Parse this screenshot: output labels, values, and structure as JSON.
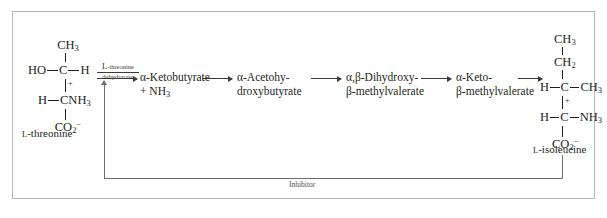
{
  "diagram": {
    "border_color": "#b9b9b9",
    "background": "#ffffff",
    "text_color": "#231f20"
  },
  "substrate": {
    "name": "L-threonine",
    "name_prefix": "L",
    "name_rest": "-threonine",
    "atoms": {
      "top": "CH",
      "top_sub": "3",
      "left": "HO",
      "center": "C",
      "right": "H",
      "lower_left": "H",
      "lower_center": "CNH",
      "lower_center_sub": "3",
      "charge": "+",
      "bottom": "CO",
      "bottom_sub": "2",
      "bottom_charge": "−"
    }
  },
  "product": {
    "name": "L-isoleucine",
    "name_prefix": "L",
    "name_rest": "-isoleucine",
    "atoms": {
      "top": "CH",
      "top_sub": "3",
      "second": "CH",
      "second_sub": "2",
      "left": "H",
      "center": "C",
      "right": "CH",
      "right_sub": "3",
      "lower_left": "H",
      "lower_center": "C",
      "lower_right": "NH",
      "lower_right_sub": "3",
      "charge": "+",
      "bottom": "CO",
      "bottom_sub": "2",
      "bottom_charge": "−"
    }
  },
  "enzyme": {
    "line1_prefix": "L",
    "line1_rest": "-threonine",
    "line2": "dehydrarase"
  },
  "intermediates": [
    {
      "line1": "α-Ketobutyrate",
      "line2": "+ NH",
      "line2_sub": "3"
    },
    {
      "line1": "α-Acetohy-",
      "line2": "droxybutyrate",
      "line2_sub": ""
    },
    {
      "line1": "α,β-Dihydroxy-",
      "line2": "β-methylvalerate",
      "line2_sub": ""
    },
    {
      "line1": "α-Keto-",
      "line2": "β-methylvalerate",
      "line2_sub": ""
    }
  ],
  "feedback": {
    "label": "Inhibitor",
    "color": "#6d6d6d"
  }
}
